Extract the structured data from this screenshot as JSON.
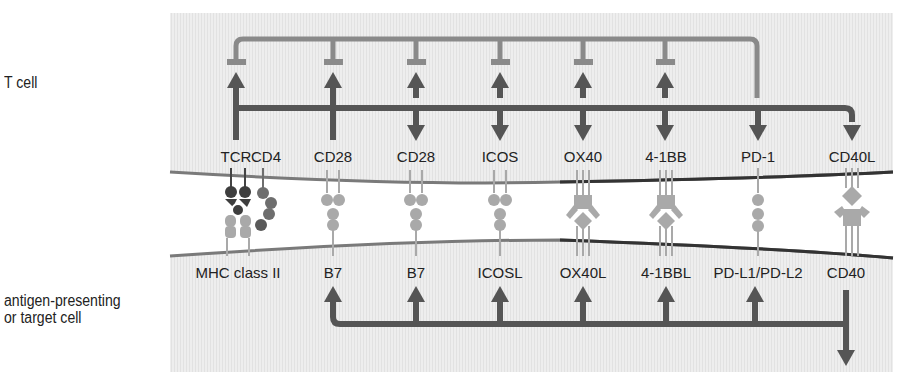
{
  "side_labels": {
    "top_cell": "T cell",
    "bottom_cell_line1": "antigen-presenting",
    "bottom_cell_line2": "or target cell"
  },
  "colors": {
    "panel_bg": "#ececec",
    "inhibitory_line": "#8a8a8a",
    "stimulatory_line": "#555555",
    "membrane": "#7a7a7a",
    "membrane_right": "#333333",
    "receptor_light": "#a9a9a9",
    "receptor_dark": "#4a4a4a",
    "receptor_mid": "#777777",
    "cleft": "#ffffff"
  },
  "t_cell_receptors": [
    {
      "id": "tcr",
      "label": "TCR"
    },
    {
      "id": "cd4",
      "label": "CD4"
    },
    {
      "id": "cd28-a",
      "label": "CD28"
    },
    {
      "id": "cd28-b",
      "label": "CD28"
    },
    {
      "id": "icos",
      "label": "ICOS"
    },
    {
      "id": "ox40",
      "label": "OX40"
    },
    {
      "id": "4-1bb",
      "label": "4-1BB"
    },
    {
      "id": "pd-1",
      "label": "PD-1"
    },
    {
      "id": "cd40l",
      "label": "CD40L"
    }
  ],
  "apc_ligands": [
    {
      "id": "mhc-ii",
      "label": "MHC class II"
    },
    {
      "id": "b7-a",
      "label": "B7"
    },
    {
      "id": "b7-b",
      "label": "B7"
    },
    {
      "id": "icosl",
      "label": "ICOSL"
    },
    {
      "id": "ox40l",
      "label": "OX40L"
    },
    {
      "id": "4-1bbl",
      "label": "4-1BBL"
    },
    {
      "id": "pd-l1-l2",
      "label": "PD-L1/PD-L2"
    },
    {
      "id": "cd40",
      "label": "CD40"
    }
  ],
  "signaling": {
    "pd1_inhibits": [
      "TCR",
      "CD28",
      "CD28",
      "ICOS",
      "OX40",
      "4-1BB"
    ],
    "tcr_induces": [
      "CD28",
      "ICOS",
      "OX40",
      "4-1BB",
      "PD-1",
      "CD40L"
    ],
    "cd40_induces": [
      "B7",
      "B7",
      "ICOSL",
      "OX40L",
      "4-1BBL",
      "PD-L1/PD-L2"
    ]
  }
}
